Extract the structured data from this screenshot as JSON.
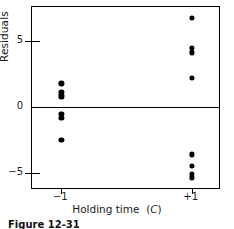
{
  "figure": {
    "caption": "Figure 12-31"
  },
  "chart_data": {
    "type": "scatter",
    "title": "",
    "xlabel": "Holding time (C)",
    "xlabel_plain": "Holding time",
    "xlabel_italic_part": "C",
    "ylabel": "Residuals",
    "xlim": [
      -1.45,
      1.45
    ],
    "ylim": [
      -6.3,
      7.6
    ],
    "grid": false,
    "legend": null,
    "xticks": [
      -1,
      1
    ],
    "xticklabels": [
      "−1",
      "+1"
    ],
    "yticks": [
      -5,
      0,
      5
    ],
    "yticklabels": [
      "−5",
      "0",
      "5"
    ],
    "reference_lines": [
      {
        "axis": "y",
        "value": 0
      }
    ],
    "marker": "filled-circle",
    "marker_color": "#000000",
    "series": [
      {
        "name": "Residuals vs holding time",
        "points": [
          {
            "x": -1,
            "y": 1.8
          },
          {
            "x": -1,
            "y": 1.15
          },
          {
            "x": -1,
            "y": 0.9
          },
          {
            "x": -1,
            "y": 0.75
          },
          {
            "x": -1,
            "y": -0.5
          },
          {
            "x": -1,
            "y": -0.85
          },
          {
            "x": -1,
            "y": -2.5
          },
          {
            "x": 1,
            "y": 6.8
          },
          {
            "x": 1,
            "y": 4.5
          },
          {
            "x": 1,
            "y": 4.15
          },
          {
            "x": 1,
            "y": 2.2
          },
          {
            "x": 1,
            "y": -3.6
          },
          {
            "x": 1,
            "y": -4.5
          },
          {
            "x": 1,
            "y": -5.1
          },
          {
            "x": 1,
            "y": -5.35
          }
        ]
      }
    ]
  }
}
